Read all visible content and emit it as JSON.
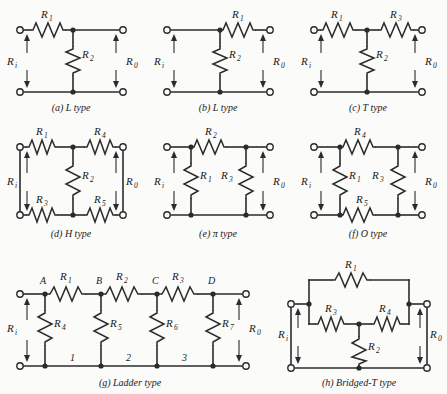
{
  "figure": {
    "background_color": "#fbfbfa",
    "ink_color": "#2b2b2b",
    "port_labels": {
      "input": "R",
      "input_sub": "i",
      "output": "R",
      "output_sub": "0"
    }
  },
  "circuits": [
    {
      "id": "a",
      "caption": "(a) L type",
      "kind": "L type",
      "resistors": [
        {
          "name": "R",
          "sub": "1",
          "orientation": "horizontal",
          "position": "series-top"
        },
        {
          "name": "R",
          "sub": "2",
          "orientation": "vertical",
          "position": "shunt-middle"
        }
      ],
      "ports": [
        "R i",
        "R 0"
      ]
    },
    {
      "id": "b",
      "caption": "(b) L type",
      "kind": "L type",
      "resistors": [
        {
          "name": "R",
          "sub": "1",
          "orientation": "horizontal",
          "position": "series-top-right"
        },
        {
          "name": "R",
          "sub": "2",
          "orientation": "vertical",
          "position": "shunt-middle"
        }
      ],
      "ports": [
        "R i",
        "R 0"
      ]
    },
    {
      "id": "c",
      "caption": "(c) T type",
      "kind": "T type",
      "resistors": [
        {
          "name": "R",
          "sub": "1",
          "orientation": "horizontal",
          "position": "series-top-left"
        },
        {
          "name": "R",
          "sub": "3",
          "orientation": "horizontal",
          "position": "series-top-right"
        },
        {
          "name": "R",
          "sub": "2",
          "orientation": "vertical",
          "position": "shunt-middle"
        }
      ],
      "ports": [
        "R i",
        "R 0"
      ]
    },
    {
      "id": "d",
      "caption": "(d) H type",
      "kind": "H type",
      "resistors": [
        {
          "name": "R",
          "sub": "1",
          "orientation": "horizontal",
          "position": "series-top-left"
        },
        {
          "name": "R",
          "sub": "4",
          "orientation": "horizontal",
          "position": "series-top-right"
        },
        {
          "name": "R",
          "sub": "2",
          "orientation": "vertical",
          "position": "shunt-middle"
        },
        {
          "name": "R",
          "sub": "3",
          "orientation": "horizontal",
          "position": "series-bottom-left"
        },
        {
          "name": "R",
          "sub": "5",
          "orientation": "horizontal",
          "position": "series-bottom-right"
        }
      ],
      "ports": [
        "R i",
        "R 0"
      ]
    },
    {
      "id": "e",
      "caption": "(e) π type",
      "kind": "π type",
      "resistors": [
        {
          "name": "R",
          "sub": "2",
          "orientation": "horizontal",
          "position": "series-top"
        },
        {
          "name": "R",
          "sub": "1",
          "orientation": "vertical",
          "position": "shunt-left"
        },
        {
          "name": "R",
          "sub": "3",
          "orientation": "vertical",
          "position": "shunt-right"
        }
      ],
      "ports": [
        "R i",
        "R 0"
      ]
    },
    {
      "id": "f",
      "caption": "(f) O type",
      "kind": "O type",
      "resistors": [
        {
          "name": "R",
          "sub": "4",
          "orientation": "horizontal",
          "position": "series-top"
        },
        {
          "name": "R",
          "sub": "1",
          "orientation": "vertical",
          "position": "shunt-left"
        },
        {
          "name": "R",
          "sub": "3",
          "orientation": "vertical",
          "position": "shunt-right"
        },
        {
          "name": "R",
          "sub": "5",
          "orientation": "horizontal",
          "position": "series-bottom"
        }
      ],
      "ports": [
        "R i",
        "R 0"
      ]
    },
    {
      "id": "g",
      "caption": "(g) Ladder type",
      "kind": "Ladder type",
      "nodes": [
        "A",
        "B",
        "C",
        "D"
      ],
      "loops": [
        "1",
        "2",
        "3"
      ],
      "resistors": [
        {
          "name": "R",
          "sub": "1",
          "orientation": "horizontal",
          "position": "series-A-B"
        },
        {
          "name": "R",
          "sub": "2",
          "orientation": "horizontal",
          "position": "series-B-C"
        },
        {
          "name": "R",
          "sub": "3",
          "orientation": "horizontal",
          "position": "series-C-D"
        },
        {
          "name": "R",
          "sub": "4",
          "orientation": "vertical",
          "position": "shunt-A"
        },
        {
          "name": "R",
          "sub": "5",
          "orientation": "vertical",
          "position": "shunt-B"
        },
        {
          "name": "R",
          "sub": "6",
          "orientation": "vertical",
          "position": "shunt-C"
        },
        {
          "name": "R",
          "sub": "7",
          "orientation": "vertical",
          "position": "shunt-D"
        }
      ],
      "ports": [
        "R i",
        "R 0"
      ]
    },
    {
      "id": "h",
      "caption": "(h) Bridged-T type",
      "kind": "Bridged-T type",
      "resistors": [
        {
          "name": "R",
          "sub": "1",
          "orientation": "horizontal",
          "position": "bridge-top"
        },
        {
          "name": "R",
          "sub": "3",
          "orientation": "horizontal",
          "position": "series-left"
        },
        {
          "name": "R",
          "sub": "4",
          "orientation": "horizontal",
          "position": "series-right"
        },
        {
          "name": "R",
          "sub": "2",
          "orientation": "vertical",
          "position": "shunt-middle"
        }
      ],
      "ports": [
        "R i",
        "R 0"
      ]
    }
  ]
}
